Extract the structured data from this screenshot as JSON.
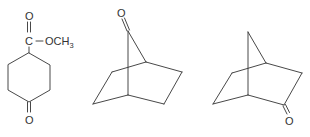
{
  "figure": {
    "type": "chemical-structures",
    "structures": [
      {
        "name": "methyl 4-oxocyclohexanecarboxylate",
        "labels": {
          "carbonyl_oxygen": "O",
          "carbonyl_carbon": "C",
          "ester_group": "OCH",
          "ester_subscript": "3",
          "ketone_oxygen": "O"
        }
      },
      {
        "name": "bicyclo[2.2.1]heptan-7-one",
        "labels": {
          "ketone_oxygen": "O"
        }
      },
      {
        "name": "bicyclo[2.2.1]heptan-2-one",
        "labels": {
          "ketone_oxygen": "O"
        }
      }
    ],
    "colors": {
      "line": "#333333",
      "background": "#ffffff"
    }
  }
}
